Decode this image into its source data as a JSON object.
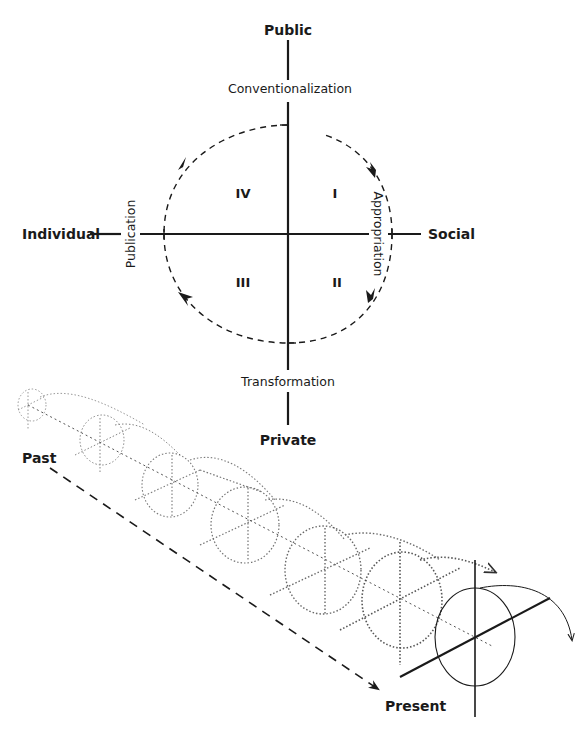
{
  "diagram": {
    "axes": {
      "top": "Public",
      "bottom": "Private",
      "left": "Individual",
      "right": "Social"
    },
    "processes": {
      "top": "Conventionalization",
      "right": "Appropriation",
      "bottom": "Transformation",
      "left": "Publication"
    },
    "quadrants": {
      "q1": "I",
      "q2": "II",
      "q3": "III",
      "q4": "IV"
    },
    "timeline": {
      "start": "Past",
      "end": "Present"
    },
    "colors": {
      "ink": "#1a1a1a",
      "background": "#ffffff"
    }
  }
}
